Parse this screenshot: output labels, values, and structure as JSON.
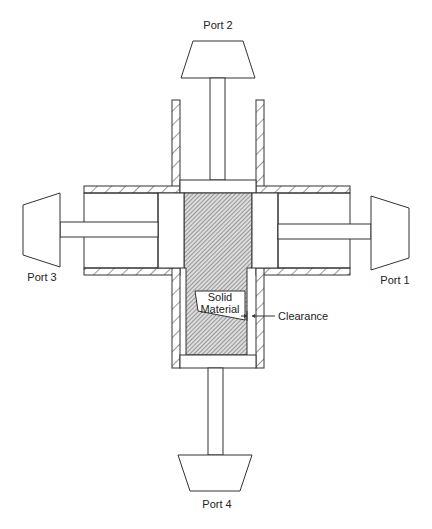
{
  "diagram": {
    "type": "schematic",
    "labels": {
      "port_top": "Port 2",
      "port_right": "Port 1",
      "port_left": "Port 3",
      "port_bottom": "Port 4",
      "solid_line1": "Solid",
      "solid_line2": "Material",
      "clearance": "Clearance"
    },
    "ports": [
      {
        "id": "port-1",
        "label": "Port 1",
        "position": "right"
      },
      {
        "id": "port-2",
        "label": "Port 2",
        "position": "top"
      },
      {
        "id": "port-3",
        "label": "Port 3",
        "position": "left"
      },
      {
        "id": "port-4",
        "label": "Port 4",
        "position": "bottom"
      }
    ],
    "colors": {
      "line": "#333333",
      "background": "#ffffff",
      "hatch": "#555555"
    }
  }
}
